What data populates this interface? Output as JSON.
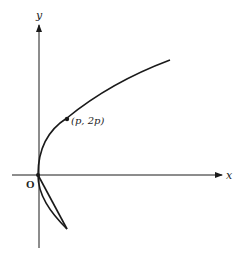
{
  "diagram": {
    "type": "parabola",
    "equation": "y^2 = 4px",
    "axes": {
      "x_label": "x",
      "y_label": "y",
      "origin_label": "O"
    },
    "point": {
      "label": "(p, 2p)"
    },
    "colors": {
      "stroke": "#1a1a1a",
      "background": "#ffffff"
    }
  }
}
